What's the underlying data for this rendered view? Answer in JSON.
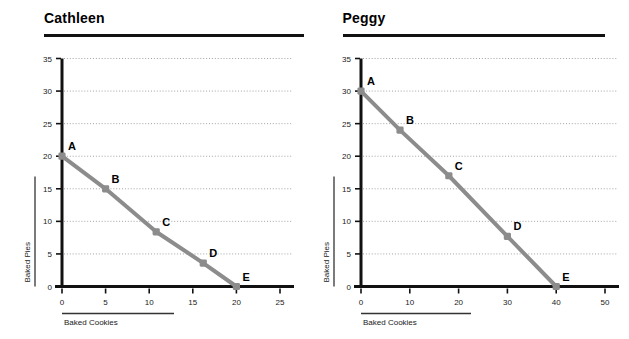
{
  "charts": [
    {
      "title": "Cathleen",
      "xlabel": "Baked Cookies",
      "ylabel": "Baked Pies",
      "xticks": [
        "0",
        "5",
        "10",
        "15",
        "20",
        "25"
      ],
      "yticks": [
        "0",
        "5",
        "10",
        "15",
        "20",
        "25",
        "30",
        "35"
      ],
      "point_labels": [
        "A",
        "B",
        "C",
        "D",
        "E"
      ]
    },
    {
      "title": "Peggy",
      "xlabel": "Baked Cookies",
      "ylabel": "Baked Pies",
      "xticks": [
        "0",
        "10",
        "20",
        "30",
        "40",
        "50"
      ],
      "yticks": [
        "0",
        "5",
        "10",
        "15",
        "20",
        "25",
        "30",
        "35"
      ],
      "point_labels": [
        "A",
        "B",
        "C",
        "D",
        "E"
      ]
    }
  ],
  "colors": {
    "line": "#8c8c8c",
    "marker": "#8c8c8c",
    "axis": "#111111",
    "grid": "#999999",
    "text": "#1a1a1a"
  },
  "chart_data": [
    {
      "type": "line",
      "title": "Cathleen",
      "xlabel": "Baked Cookies",
      "ylabel": "Baked Pies",
      "xlim": [
        0,
        25
      ],
      "ylim": [
        0,
        35
      ],
      "xticks": [
        0,
        5,
        10,
        15,
        20,
        25
      ],
      "yticks": [
        0,
        5,
        10,
        15,
        20,
        25,
        30,
        35
      ],
      "grid": "horizontal-dotted",
      "legend": "none",
      "point_labels": [
        "A",
        "B",
        "C",
        "D",
        "E"
      ],
      "x": [
        0,
        5,
        10.8,
        16.2,
        20
      ],
      "y": [
        20,
        15,
        8.4,
        3.6,
        0
      ],
      "points": [
        {
          "label": "A",
          "x": 0,
          "y": 20
        },
        {
          "label": "B",
          "x": 5,
          "y": 15
        },
        {
          "label": "C",
          "x": 10.8,
          "y": 8.4
        },
        {
          "label": "D",
          "x": 16.2,
          "y": 3.6
        },
        {
          "label": "E",
          "x": 20,
          "y": 0
        }
      ]
    },
    {
      "type": "line",
      "title": "Peggy",
      "xlabel": "Baked Cookies",
      "ylabel": "Baked Pies",
      "xlim": [
        0,
        50
      ],
      "ylim": [
        0,
        35
      ],
      "xticks": [
        0,
        10,
        20,
        30,
        40,
        50
      ],
      "yticks": [
        0,
        5,
        10,
        15,
        20,
        25,
        30,
        35
      ],
      "grid": "horizontal-dotted",
      "legend": "none",
      "point_labels": [
        "A",
        "B",
        "C",
        "D",
        "E"
      ],
      "x": [
        0,
        8,
        18,
        30,
        40
      ],
      "y": [
        30,
        24,
        17,
        7.7,
        0
      ],
      "points": [
        {
          "label": "A",
          "x": 0,
          "y": 30
        },
        {
          "label": "B",
          "x": 8,
          "y": 24
        },
        {
          "label": "C",
          "x": 18,
          "y": 17
        },
        {
          "label": "D",
          "x": 30,
          "y": 7.7
        },
        {
          "label": "E",
          "x": 40,
          "y": 0
        }
      ]
    }
  ]
}
